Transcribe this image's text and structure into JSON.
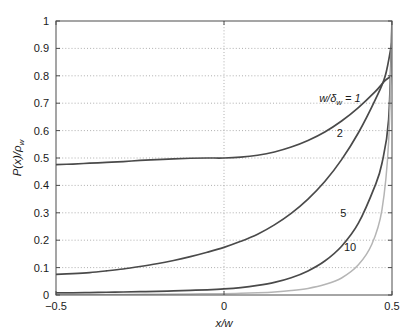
{
  "figure": {
    "background_color": "#ffffff",
    "frame_color": "#4d4d4d",
    "grid_color": "#8c8c8c"
  },
  "chart_data": {
    "type": "line",
    "title": "",
    "subtitle": "",
    "xlabel": "x/w",
    "ylabel": "P(x)/ρw",
    "ylabel_parts": {
      "lead": "P(x)/ρ",
      "sub": "w"
    },
    "xlim": [
      -0.5,
      0.5
    ],
    "ylim": [
      0,
      1
    ],
    "grid": true,
    "grid_style": "dotted",
    "legend_position": "inline-annotations",
    "xticks": [
      -0.5,
      0,
      0.5
    ],
    "xtick_labels": [
      "−0.5",
      "0",
      "0.5"
    ],
    "yticks": [
      0,
      0.1,
      0.2,
      0.3,
      0.4,
      0.5,
      0.6,
      0.7,
      0.8,
      0.9,
      1
    ],
    "ytick_labels": [
      "0",
      "0.1",
      "0.2",
      "0.3",
      "0.4",
      "0.5",
      "0.6",
      "0.7",
      "0.8",
      "0.9",
      "1"
    ],
    "annotations": [
      {
        "name": "curve-label-1",
        "text_lead": "w/δ",
        "text_sub": "w",
        "text_tail": " = 1",
        "x": 0.345,
        "y": 0.705
      },
      {
        "name": "curve-label-2",
        "text": "2",
        "x": 0.345,
        "y": 0.575
      },
      {
        "name": "curve-label-5",
        "text": "5",
        "x": 0.355,
        "y": 0.285
      },
      {
        "name": "curve-label-10",
        "text": "10",
        "x": 0.375,
        "y": 0.16
      }
    ],
    "series": [
      {
        "name": "w/δw = 1",
        "label": "1",
        "color": "#4a4a4a",
        "linewidth": 1.7,
        "x": [
          -0.5,
          -0.45,
          -0.4,
          -0.35,
          -0.3,
          -0.25,
          -0.2,
          -0.15,
          -0.1,
          -0.05,
          0,
          0.05,
          0.1,
          0.15,
          0.2,
          0.25,
          0.3,
          0.35,
          0.4,
          0.45,
          0.48,
          0.5
        ],
        "y": [
          0.476,
          0.478,
          0.481,
          0.484,
          0.487,
          0.491,
          0.494,
          0.497,
          0.499,
          0.5,
          0.5,
          0.503,
          0.51,
          0.522,
          0.54,
          0.564,
          0.595,
          0.635,
          0.684,
          0.742,
          0.783,
          0.8
        ]
      },
      {
        "name": "w/δw = 2",
        "label": "2",
        "color": "#4a4a4a",
        "linewidth": 1.7,
        "x": [
          -0.5,
          -0.45,
          -0.4,
          -0.35,
          -0.3,
          -0.25,
          -0.2,
          -0.15,
          -0.1,
          -0.05,
          0,
          0.05,
          0.1,
          0.15,
          0.2,
          0.25,
          0.3,
          0.35,
          0.4,
          0.45,
          0.48,
          0.5
        ],
        "y": [
          0.075,
          0.078,
          0.082,
          0.088,
          0.095,
          0.104,
          0.114,
          0.126,
          0.14,
          0.156,
          0.174,
          0.196,
          0.222,
          0.256,
          0.298,
          0.35,
          0.414,
          0.494,
          0.592,
          0.712,
          0.8,
          0.925
        ]
      },
      {
        "name": "w/δw = 5",
        "label": "5",
        "color": "#4a4a4a",
        "linewidth": 1.7,
        "x": [
          -0.5,
          -0.45,
          -0.4,
          -0.35,
          -0.3,
          -0.25,
          -0.2,
          -0.15,
          -0.1,
          -0.05,
          0,
          0.05,
          0.1,
          0.15,
          0.2,
          0.25,
          0.3,
          0.35,
          0.4,
          0.45,
          0.47,
          0.49,
          0.5
        ],
        "y": [
          0.008,
          0.008,
          0.009,
          0.01,
          0.011,
          0.012,
          0.013,
          0.015,
          0.017,
          0.019,
          0.022,
          0.027,
          0.035,
          0.046,
          0.063,
          0.088,
          0.124,
          0.178,
          0.262,
          0.4,
          0.48,
          0.64,
          1.0
        ]
      },
      {
        "name": "w/δw = 10",
        "label": "10",
        "color": "#b5b5b5",
        "linewidth": 1.5,
        "x": [
          -0.5,
          -0.4,
          -0.3,
          -0.2,
          -0.1,
          0,
          0.05,
          0.1,
          0.15,
          0.2,
          0.25,
          0.3,
          0.35,
          0.4,
          0.44,
          0.47,
          0.49,
          0.5
        ],
        "y": [
          0.002,
          0.002,
          0.002,
          0.003,
          0.004,
          0.005,
          0.006,
          0.008,
          0.011,
          0.016,
          0.024,
          0.038,
          0.062,
          0.11,
          0.185,
          0.31,
          0.56,
          1.0
        ]
      }
    ]
  }
}
